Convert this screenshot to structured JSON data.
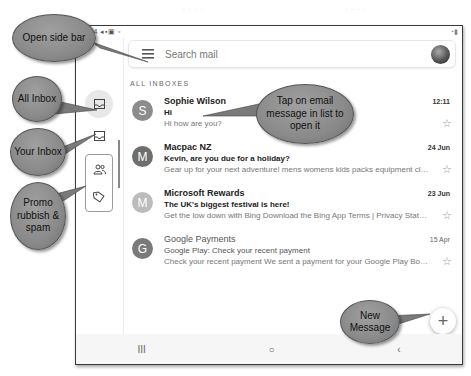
{
  "status_bar": {
    "left": "12:34 ◂▪▣ ▫",
    "right": "◔▮"
  },
  "search": {
    "placeholder": "Search mail"
  },
  "section_label": "ALL INBOXES",
  "rail": {
    "items": [
      {
        "name": "all-inboxes",
        "icon": "inbox-icon",
        "active": true
      },
      {
        "name": "your-inbox",
        "icon": "inbox-icon",
        "active": false
      },
      {
        "name": "social",
        "icon": "people-icon",
        "active": false
      },
      {
        "name": "promotions",
        "icon": "tag-icon",
        "active": false
      }
    ]
  },
  "emails": [
    {
      "avatar": "S",
      "avatar_color": "#8c8c8c",
      "from": "Sophie Wilson",
      "subject": "Hi",
      "snippet": "Hi how are you?",
      "date": "12:11",
      "unread": true
    },
    {
      "avatar": "M",
      "avatar_color": "#6e6e6e",
      "from": "Macpac NZ",
      "subject": "Kevin, are you due for a holiday?",
      "snippet": "Gear up for your next adventure! mens womens kids packs equipment clearance...",
      "date": "24 Jun",
      "unread": true
    },
    {
      "avatar": "M",
      "avatar_color": "#bcbcbc",
      "from": "Microsoft Rewards",
      "subject": "The UK's biggest festival is here!",
      "snippet": "Get the low down with Bing Download the Bing App Terms | Privacy Statement | Un...",
      "date": "23 Jun",
      "unread": true
    },
    {
      "avatar": "G",
      "avatar_color": "#7a7a7a",
      "from": "Google Payments",
      "subject": "Google Play: Check your recent payment",
      "snippet": "Check your recent payment We sent a payment for your Google Play Books earnin...",
      "date": "15 Apr",
      "unread": false
    }
  ],
  "fab": {
    "label": "+"
  },
  "navbar": {
    "recents": "III",
    "home": "○",
    "back": "‹"
  },
  "callouts": {
    "open_sidebar": "Open side bar",
    "all_inbox": "All Inbox",
    "your_inbox": "Your Inbox",
    "promo": "Promo rubbish & spam",
    "tap_email": "Tap on email message in list to open it",
    "new_message": "New Message"
  }
}
